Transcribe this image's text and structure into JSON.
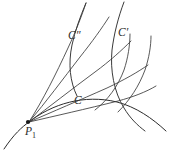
{
  "figure": {
    "background_color": "#ffffff",
    "line_color": "#2b2b2b",
    "width": 172,
    "height": 156,
    "labels": {
      "curve_C": "C",
      "curve_C_prime_letter": "C",
      "curve_C_prime_mark": "′",
      "curve_C_double_prime_letter": "C",
      "curve_C_double_prime_mark": "″",
      "point_P_letter": "P",
      "point_P_subscript": "1"
    },
    "elements": {
      "vertex_point_name": "P1",
      "fan_curve_count": 5,
      "transversal_arc_count": 2,
      "labeled_curves": [
        "C",
        "C′",
        "C″"
      ]
    }
  },
  "geometry": {
    "vertex": {
      "x": 28,
      "y": 122
    },
    "base_curve_C": "M 4 149 C 14 134 22 127 29 122 C 52 104 84 94 117 102 C 136 107 152 118 166 131",
    "fan_curves": [
      "M 29 122 C 55 116 86 109 118 101 C 133 97 146 92 156 86",
      "M 29 122 C 52 112 80 100 107 88 C 124 80 138 72 148 65",
      "M 29 122 C 49 107 72 89 95 72 C 110 61 122 50 131 41",
      "M 29 122 C 46 102 63 79 80 57 C 92 42 102 28 109 17",
      "M 29 122 C 43 100 56 74 68 48 C 76 31 82 15 86 3"
    ],
    "outer_curve_C_prime": "M 124 2 C 118 18 114 34 112 50 C 110 70 114 92 124 108 C 130 118 137 125 145 131",
    "outer_curve_C_double_prime": "M 86 3 C 80 17 75 31 72 45 C 68 64 70 82 77 96",
    "transversal_arcs": [
      "M 95 110 C 108 100 118 86 124 70 C 128 58 130 45 130 34",
      "M 118 112 C 130 100 139 86 145 70 C 149 58 151 46 151 36"
    ]
  }
}
